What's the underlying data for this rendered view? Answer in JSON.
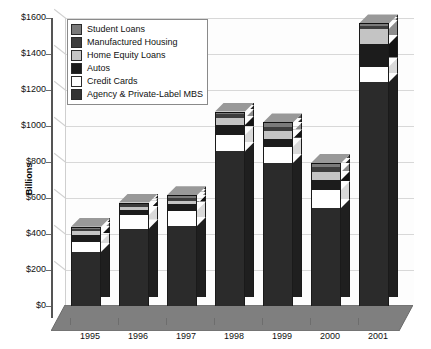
{
  "chart_data": {
    "type": "bar",
    "subtype": "stacked-bar-3d",
    "title": "",
    "xlabel": "",
    "ylabel": "Billions",
    "ylim": [
      0,
      1600
    ],
    "ytick_step": 200,
    "ytick_labels": [
      "$0",
      "$200",
      "$400",
      "$600",
      "$800",
      "$1000",
      "$1200",
      "$1400",
      "$1600"
    ],
    "grid": true,
    "legend_position": "top-left-inside",
    "categories": [
      "1995",
      "1996",
      "1997",
      "1998",
      "1999",
      "2000",
      "2001"
    ],
    "series": [
      {
        "name": "Agency & Private-Label MBS",
        "color": "#2b2b2b",
        "values": [
          300,
          430,
          445,
          860,
          795,
          545,
          1245
        ]
      },
      {
        "name": "Credit Cards",
        "color": "#ffffff",
        "values": [
          55,
          75,
          85,
          90,
          90,
          100,
          85
        ]
      },
      {
        "name": "Autos",
        "color": "#1c1c1c",
        "values": [
          40,
          30,
          35,
          55,
          45,
          55,
          125
        ]
      },
      {
        "name": "Home Equity Loans",
        "color": "#c4c4c4",
        "values": [
          20,
          15,
          20,
          40,
          40,
          45,
          85
        ]
      },
      {
        "name": "Manufactured Housing",
        "color": "#3d3d3d",
        "values": [
          15,
          15,
          15,
          20,
          25,
          25,
          15
        ]
      },
      {
        "name": "Student Loans",
        "color": "#7a7a7a",
        "values": [
          10,
          10,
          15,
          15,
          25,
          25,
          15
        ]
      }
    ],
    "totals": [
      440,
      575,
      615,
      1080,
      1020,
      795,
      1570
    ]
  },
  "legend": {
    "items": [
      {
        "label": "Student Loans",
        "color": "#7a7a7a"
      },
      {
        "label": "Manufactured Housing",
        "color": "#3d3d3d"
      },
      {
        "label": "Home Equity Loans",
        "color": "#c4c4c4"
      },
      {
        "label": "Autos",
        "color": "#1c1c1c"
      },
      {
        "label": "Credit Cards",
        "color": "#ffffff"
      },
      {
        "label": "Agency & Private-Label MBS",
        "color": "#333333"
      }
    ]
  }
}
